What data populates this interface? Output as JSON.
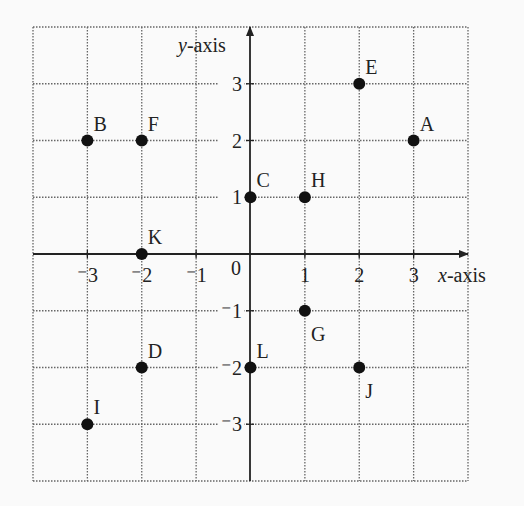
{
  "chart_data": {
    "type": "scatter",
    "title": "",
    "xlabel": "x-axis",
    "ylabel": "y-axis",
    "xlim": [
      -4,
      4
    ],
    "ylim": [
      -4,
      4
    ],
    "grid": true,
    "x_ticks": [
      -3,
      -2,
      -1,
      1,
      2,
      3
    ],
    "y_ticks": [
      3,
      2,
      1,
      -1,
      -2,
      -3
    ],
    "origin_label": "0",
    "points": [
      {
        "label": "A",
        "x": 3,
        "y": 2,
        "label_pos": "ne"
      },
      {
        "label": "B",
        "x": -3,
        "y": 2,
        "label_pos": "ne"
      },
      {
        "label": "C",
        "x": 0,
        "y": 1,
        "label_pos": "ne"
      },
      {
        "label": "D",
        "x": -2,
        "y": -2,
        "label_pos": "ne"
      },
      {
        "label": "E",
        "x": 2,
        "y": 3,
        "label_pos": "ne"
      },
      {
        "label": "F",
        "x": -2,
        "y": 2,
        "label_pos": "ne"
      },
      {
        "label": "G",
        "x": 1,
        "y": -1,
        "label_pos": "se"
      },
      {
        "label": "H",
        "x": 1,
        "y": 1,
        "label_pos": "ne"
      },
      {
        "label": "I",
        "x": -3,
        "y": -3,
        "label_pos": "ne"
      },
      {
        "label": "J",
        "x": 2,
        "y": -2,
        "label_pos": "se"
      },
      {
        "label": "K",
        "x": -2,
        "y": 0,
        "label_pos": "ne"
      },
      {
        "label": "L",
        "x": 0,
        "y": -2,
        "label_pos": "ne"
      }
    ]
  },
  "labels": {
    "x_axis_var": "x",
    "x_axis_suffix": "-axis",
    "y_axis_var": "y",
    "y_axis_suffix": "-axis"
  }
}
